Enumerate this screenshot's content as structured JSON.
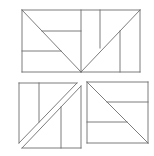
{
  "diagram": {
    "stroke_color": "#6e6e6e",
    "background": "#ffffff",
    "figures": [
      {
        "name": "top-rectangle",
        "bounds": {
          "x": 22,
          "y": 10,
          "w": 118,
          "h": 62
        },
        "lines": [
          [
            22,
            10,
            140,
            10
          ],
          [
            22,
            72,
            140,
            72
          ],
          [
            22,
            10,
            22,
            72
          ],
          [
            140,
            10,
            140,
            72
          ],
          [
            22,
            10,
            81,
            72
          ],
          [
            140,
            10,
            81,
            72
          ],
          [
            81,
            10,
            81,
            72
          ],
          [
            100,
            10,
            100,
            48
          ],
          [
            120,
            31,
            120,
            72
          ],
          [
            42,
            31,
            81,
            31
          ],
          [
            22,
            51,
            61,
            51
          ]
        ]
      },
      {
        "name": "bottom-left-square-split",
        "pieces": [
          {
            "name": "upper-left-triangle",
            "lines": [
              [
                19,
                83,
                77,
                83
              ],
              [
                19,
                83,
                19,
                143
              ],
              [
                19,
                143,
                77,
                83
              ],
              [
                39,
                83,
                39,
                122
              ]
            ]
          },
          {
            "name": "lower-right-triangle",
            "lines": [
              [
                81,
                86,
                81,
                148
              ],
              [
                22,
                148,
                81,
                148
              ],
              [
                22,
                148,
                81,
                86
              ],
              [
                61,
                107,
                61,
                148
              ]
            ]
          }
        ]
      },
      {
        "name": "bottom-right-square",
        "bounds": {
          "x": 87,
          "y": 82,
          "w": 61,
          "h": 61
        },
        "lines": [
          [
            87,
            82,
            148,
            82
          ],
          [
            87,
            143,
            148,
            143
          ],
          [
            87,
            82,
            87,
            143
          ],
          [
            148,
            82,
            148,
            143
          ],
          [
            87,
            82,
            148,
            143
          ],
          [
            107,
            102,
            148,
            102
          ],
          [
            87,
            122,
            127,
            122
          ]
        ]
      }
    ]
  }
}
